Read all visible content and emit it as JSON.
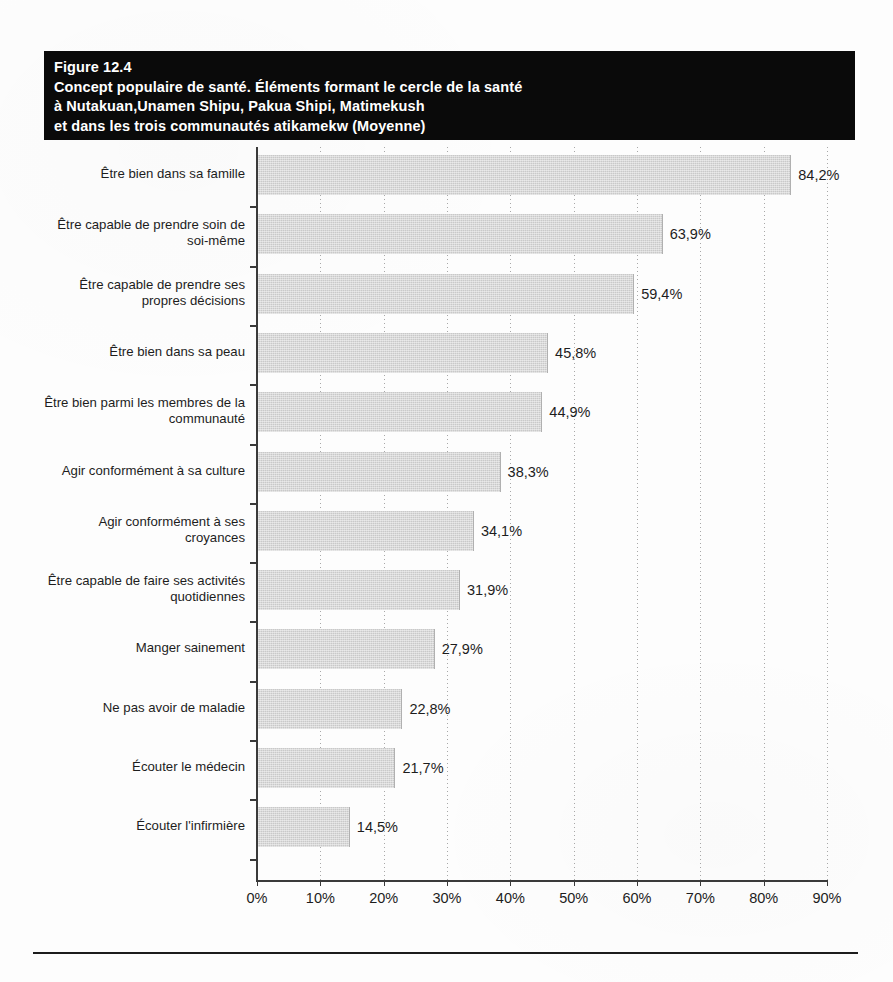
{
  "figure": {
    "banner_lines": [
      "Figure 12.4",
      "Concept populaire de santé. Éléments formant le cercle de la santé",
      "à Nutakuan,Unamen Shipu, Pakua Shipi, Matimekush",
      "et dans les trois communautés atikamekw (Moyenne)"
    ]
  },
  "chart_data": {
    "type": "bar",
    "orientation": "horizontal",
    "xlabel": "",
    "ylabel": "",
    "xlim": [
      0,
      90
    ],
    "xticks": [
      0,
      10,
      20,
      30,
      40,
      50,
      60,
      70,
      80,
      90
    ],
    "xticklabels": [
      "0%",
      "10%",
      "20%",
      "30%",
      "40%",
      "50%",
      "60%",
      "70%",
      "80%",
      "90%"
    ],
    "grid": "vertical-dotted",
    "legend": "none",
    "bar_color": "#c9c9c9",
    "categories": [
      "Être bien dans sa famille",
      "Être capable de prendre soin de soi-même",
      "Être capable de prendre ses propres décisions",
      "Être bien dans sa peau",
      "Être bien parmi les membres de la communauté",
      "Agir conformément à sa culture",
      "Agir conformément à ses croyances",
      "Être capable de faire ses activités quotidiennes",
      "Manger sainement",
      "Ne pas avoir de maladie",
      "Écouter le médecin",
      "Écouter l'infirmière"
    ],
    "category_lines": [
      [
        "Être bien dans sa famille"
      ],
      [
        "Être capable de prendre soin de",
        "soi-même"
      ],
      [
        "Être capable de prendre ses",
        "propres décisions"
      ],
      [
        "Être bien dans sa peau"
      ],
      [
        "Être bien parmi les membres de la",
        "communauté"
      ],
      [
        "Agir conformément à sa culture"
      ],
      [
        "Agir conformément à ses",
        "croyances"
      ],
      [
        "Être capable de faire ses activités",
        "quotidiennes"
      ],
      [
        "Manger sainement"
      ],
      [
        "Ne pas avoir de maladie"
      ],
      [
        "Écouter le médecin"
      ],
      [
        "Écouter l'infirmière"
      ]
    ],
    "values": [
      84.2,
      63.9,
      59.4,
      45.8,
      44.9,
      38.3,
      34.1,
      31.9,
      27.9,
      22.8,
      21.7,
      14.5
    ],
    "value_labels": [
      "84,2%",
      "63,9%",
      "59,4%",
      "45,8%",
      "44,9%",
      "38,3%",
      "34,1%",
      "31,9%",
      "27,9%",
      "22,8%",
      "21,7%",
      "14,5%"
    ]
  }
}
